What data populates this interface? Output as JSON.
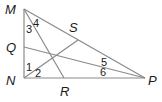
{
  "figure": {
    "type": "triangle-with-cevians",
    "vertices": {
      "M": {
        "label": "M",
        "x": 24,
        "y": 9
      },
      "N": {
        "label": "N",
        "x": 24,
        "y": 78
      },
      "P": {
        "label": "P",
        "x": 145,
        "y": 78
      }
    },
    "points": {
      "Q": {
        "label": "Q",
        "x": 24,
        "y": 47
      },
      "R": {
        "label": "R",
        "x": 64,
        "y": 78
      },
      "S": {
        "label": "S",
        "x": 78,
        "y": 36
      }
    },
    "angle_labels": [
      "1",
      "2",
      "3",
      "4",
      "5",
      "6"
    ],
    "segments": [
      "MN",
      "NP",
      "MP",
      "MR",
      "NS",
      "QP"
    ]
  },
  "labels": {
    "M": "M",
    "N": "N",
    "P": "P",
    "Q": "Q",
    "R": "R",
    "S": "S",
    "a1": "1",
    "a2": "2",
    "a3": "3",
    "a4": "4",
    "a5": "5",
    "a6": "6"
  }
}
